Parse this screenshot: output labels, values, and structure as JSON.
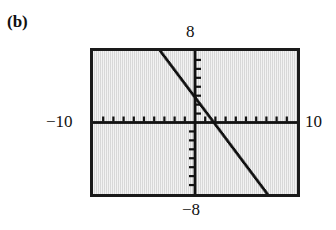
{
  "figure": {
    "part_label": "(b)",
    "caption_style": "bold-serif"
  },
  "labels": {
    "y_max": "8",
    "y_min": "−8",
    "x_min": "−10",
    "x_max": "10"
  },
  "colors": {
    "screen_background": "#e3e3e3",
    "frame_border": "#1a1a1a",
    "axis": "#111111",
    "curve": "#111111",
    "page_background": "#ffffff"
  },
  "chart_data": {
    "type": "line",
    "title": "",
    "xlabel": "",
    "ylabel": "",
    "xlim": [
      -10,
      10
    ],
    "ylim": [
      -8,
      8
    ],
    "grid": false,
    "legend": null,
    "axis_style": "calculator-window-with-tick-marks",
    "x_tick_step": 1,
    "y_tick_step": 1,
    "x_ticks": [
      -9,
      -8,
      -7,
      -6,
      -5,
      -4,
      -3,
      -2,
      -1,
      1,
      2,
      3,
      4,
      5,
      6,
      7,
      8,
      9
    ],
    "y_ticks": [
      -7,
      -6,
      -5,
      -4,
      -3,
      -2,
      -1,
      1,
      2,
      3,
      4,
      5,
      6,
      7
    ],
    "series": [
      {
        "name": "line",
        "description": "steeply decreasing straight line from upper-left to lower-right",
        "slope": -1.8,
        "intercept": -1.2,
        "x": [
          -3.4,
          -2.0,
          -1.0,
          0.0,
          0.67,
          2.0,
          4.0,
          6.0,
          7.0
        ],
        "y": [
          8.0,
          4.8,
          2.8,
          -1.2,
          -2.4,
          -4.8,
          -8.0,
          -8.0,
          -8.0
        ],
        "x_start": -3.4,
        "y_start": 8.0,
        "x_end": 7.1,
        "y_end": -8.0,
        "x_intercept": 0.67,
        "y_intercept": -1.2,
        "render": "dotted-pixelated"
      }
    ]
  }
}
